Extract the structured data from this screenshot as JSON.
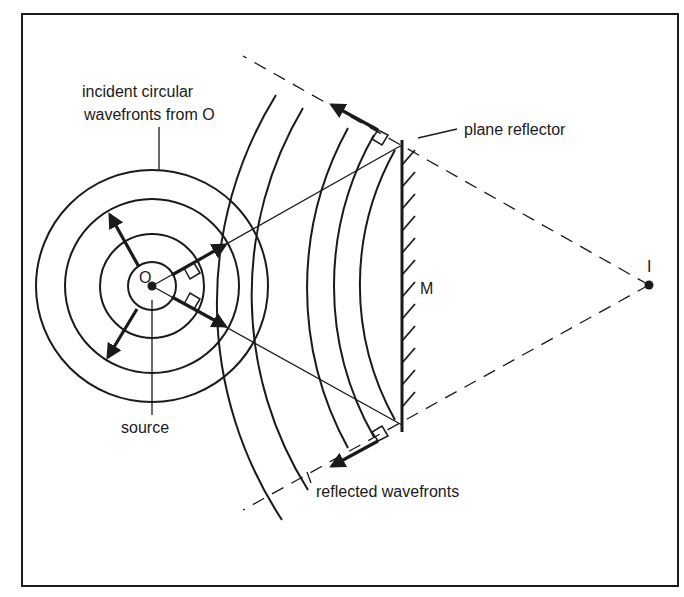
{
  "diagram": {
    "colors": {
      "ink": "#1a1a1a",
      "background": "#ffffff"
    },
    "labels": {
      "incident_line1": "incident circular",
      "incident_line2": "wavefronts from O",
      "source": "source",
      "source_point": "O",
      "plane_reflector": "plane reflector",
      "mirror": "M",
      "image_point": "I",
      "reflected": "reflected wavefronts"
    },
    "geometry": {
      "frame": {
        "x": 22,
        "y": 14,
        "width": 656,
        "height": 572
      },
      "source_O": {
        "x": 152,
        "y": 286
      },
      "image_I": {
        "x": 649,
        "y": 285
      },
      "incident_circle_radii": [
        24,
        52,
        87,
        116
      ],
      "reflected_arc_radii": [
        395,
        366,
        333,
        305,
        277
      ],
      "mirror": {
        "x": 402,
        "top_y": 145,
        "bottom_y": 425
      }
    }
  }
}
